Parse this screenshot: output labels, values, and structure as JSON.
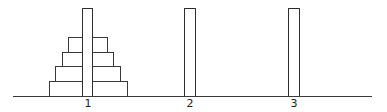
{
  "diagram": {
    "type": "tower-of-hanoi",
    "stroke_color": "#3a3a3a",
    "background": "#ffffff",
    "baseline": {
      "x1": 13,
      "x2": 372,
      "y": 96
    },
    "pegs": [
      {
        "label": "1",
        "x": 82,
        "width": 11,
        "top": 8,
        "bottom": 96
      },
      {
        "label": "2",
        "x": 184,
        "width": 12,
        "top": 8,
        "bottom": 96
      },
      {
        "label": "3",
        "x": 288,
        "width": 12,
        "top": 8,
        "bottom": 96
      }
    ],
    "disks": [
      {
        "size": 1,
        "peg": "1",
        "x1": 68,
        "x2": 108,
        "top": 37,
        "bottom": 52
      },
      {
        "size": 2,
        "peg": "1",
        "x1": 62,
        "x2": 114,
        "top": 52,
        "bottom": 66
      },
      {
        "size": 3,
        "peg": "1",
        "x1": 55,
        "x2": 121,
        "top": 66,
        "bottom": 81
      },
      {
        "size": 4,
        "peg": "1",
        "x1": 49,
        "x2": 128,
        "top": 81,
        "bottom": 96
      }
    ]
  }
}
